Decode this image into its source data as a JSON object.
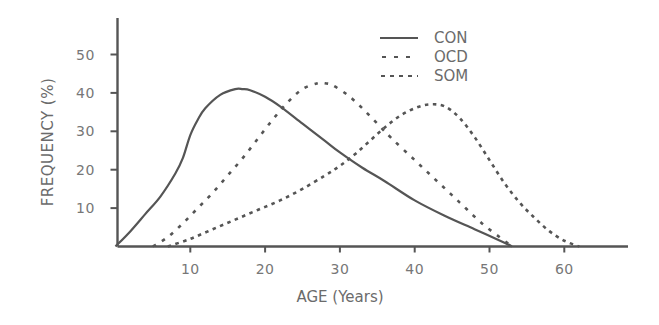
{
  "chart_data": {
    "type": "line",
    "title": "",
    "xlabel": "AGE (Years)",
    "ylabel": "FREQUENCY (%)",
    "xlim": [
      0,
      70
    ],
    "ylim": [
      0,
      58
    ],
    "x_ticks": [
      10,
      20,
      30,
      40,
      50,
      60
    ],
    "y_ticks": [
      10,
      20,
      30,
      40,
      50
    ],
    "grid": false,
    "legend_position": "top-right",
    "series": [
      {
        "name": "CON",
        "style": "solid",
        "x": [
          0,
          2,
          4,
          6,
          8,
          9,
          10,
          11,
          12,
          14,
          16,
          17,
          18,
          20,
          22,
          25,
          28,
          30,
          33,
          36,
          40,
          44,
          48,
          52,
          53
        ],
        "y": [
          0,
          4,
          8.5,
          13,
          19,
          23,
          29,
          33,
          36,
          39.5,
          41,
          41,
          40.7,
          39,
          36.5,
          32,
          27.5,
          24.5,
          20.5,
          17,
          12,
          8,
          4.5,
          1,
          0
        ]
      },
      {
        "name": "OCD",
        "style": "dashed",
        "x": [
          5,
          7,
          9,
          11,
          13,
          15,
          17,
          19,
          21,
          23,
          25,
          27,
          28,
          29,
          31,
          33,
          35,
          37,
          40,
          43,
          46,
          49,
          52,
          53
        ],
        "y": [
          0,
          2.5,
          6,
          10,
          14,
          18.5,
          23,
          28,
          33,
          37.5,
          41,
          42.5,
          42.5,
          42,
          39.5,
          36,
          32,
          28,
          22.5,
          17,
          11.5,
          6,
          1.5,
          0
        ]
      },
      {
        "name": "SOM",
        "style": "dotted",
        "x": [
          7,
          10,
          13,
          16,
          19,
          22,
          25,
          28,
          30,
          32,
          34,
          36,
          38,
          40,
          42,
          44,
          46,
          48,
          50,
          52,
          54,
          56,
          58,
          60,
          62
        ],
        "y": [
          0,
          2,
          4.5,
          7,
          9.5,
          12,
          15,
          18.5,
          21,
          24,
          27.5,
          31,
          34,
          36,
          37,
          36.5,
          33.5,
          28.5,
          22.5,
          16.5,
          11.5,
          7.5,
          4,
          1.5,
          0
        ]
      }
    ]
  },
  "axes": {
    "x_title": "AGE (Years)",
    "y_title": "FREQUENCY (%)",
    "x_tick_labels": [
      "10",
      "20",
      "30",
      "40",
      "50",
      "60"
    ],
    "y_tick_labels": [
      "50",
      "40",
      "30",
      "20",
      "10"
    ]
  },
  "legend": {
    "items": [
      {
        "label": "CON",
        "style": "solid"
      },
      {
        "label": "OCD",
        "style": "dashed"
      },
      {
        "label": "SOM",
        "style": "dotted"
      }
    ]
  },
  "colors": {
    "line": "#555555",
    "axis": "#555555",
    "text": "#6b6b6b"
  }
}
